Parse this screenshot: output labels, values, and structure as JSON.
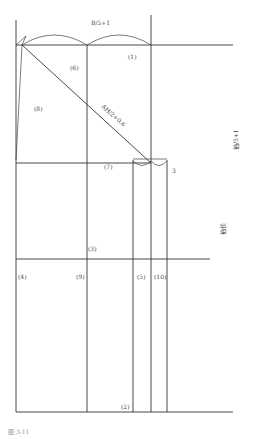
{
  "diagram": {
    "type": "garment-pattern-draft",
    "top_measure": "B/5+1",
    "diagonal_measure": "AH/2+0.6",
    "right_vertical_measure": "袖/5+1",
    "right_length_label": "袖长",
    "offset_label": "3",
    "piece_labels": {
      "p1": "(1)",
      "p2": "(2)",
      "p3": "(3)",
      "p4": "(4)",
      "p5": "(5)",
      "p6": "(6)",
      "p7": "(7)",
      "p8": "(8)",
      "p9": "(9)",
      "p10": "(10)"
    },
    "caption": "图 3-11"
  }
}
